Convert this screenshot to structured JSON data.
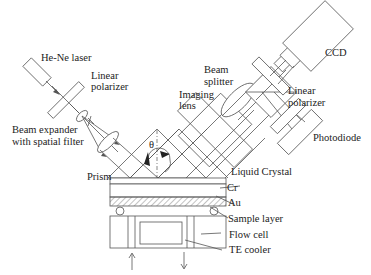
{
  "figure": {
    "type": "optical setup schematic (surface plasmon resonance imaging)",
    "labels": {
      "laser": "He-Ne laser",
      "polarizer_in_1": "Linear",
      "polarizer_in_2": "polarizer",
      "expander_1": "Beam expander",
      "expander_2": "with spatial filter",
      "prism": "Prism",
      "angle": "θ",
      "imaging_lens_1": "Imaging",
      "imaging_lens_2": "lens",
      "beam_splitter_1": "Beam",
      "beam_splitter_2": "splitter",
      "polarizer_out_1": "Linear",
      "polarizer_out_2": "polarizer",
      "ccd": "CCD",
      "photodiode": "Photodiode",
      "liquid_crystal": "Liquid Crystal",
      "cr": "Cr",
      "au": "Au",
      "sample_layer": "Sample layer",
      "flow_cell": "Flow cell",
      "te_cooler": "TE cooler"
    },
    "colors": {
      "line": "#555555",
      "text": "#222222",
      "background": "#ffffff"
    }
  }
}
